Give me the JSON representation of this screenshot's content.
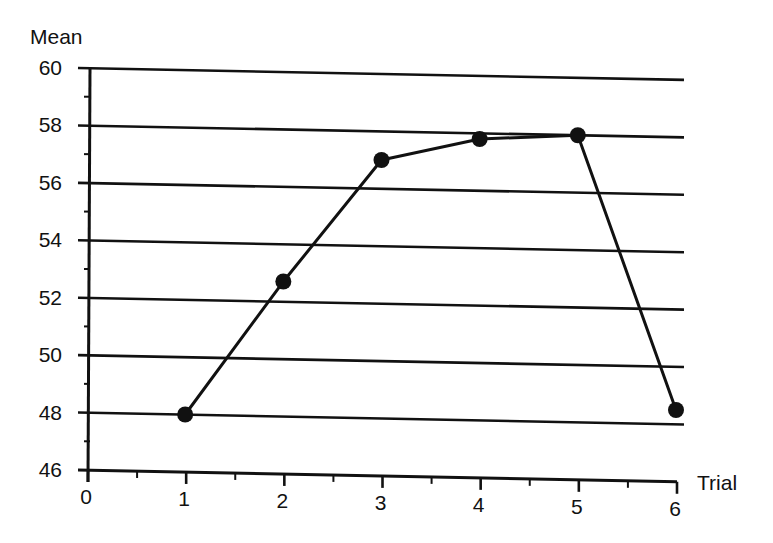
{
  "chart_data": {
    "type": "line",
    "title": "",
    "xlabel": "Trial",
    "ylabel": "Mean",
    "x": [
      1,
      2,
      3,
      4,
      5,
      6
    ],
    "series": [
      {
        "name": "Mean",
        "values": [
          48.0,
          52.7,
          57.0,
          57.8,
          58.0,
          48.5
        ]
      }
    ],
    "x_ticks": [
      "0",
      "1",
      "2",
      "3",
      "4",
      "5",
      "6"
    ],
    "y_ticks": [
      "46",
      "48",
      "50",
      "52",
      "54",
      "56",
      "58",
      "60"
    ],
    "xlim": [
      0,
      6
    ],
    "ylim": [
      46,
      60
    ],
    "grid": "horizontal",
    "legend": "none",
    "marker": "filled-circle",
    "colors": {
      "line": "#111111",
      "marker": "#111111",
      "grid": "#111111"
    }
  }
}
